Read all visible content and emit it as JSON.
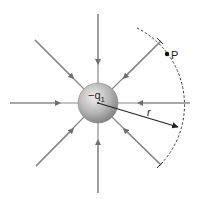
{
  "diagram": {
    "type": "electric-field-lines",
    "charge": {
      "label": "−q",
      "subscript": "1",
      "center": [
        98,
        103
      ],
      "radius": 20
    },
    "field_lines": {
      "count": 8,
      "direction": "inward",
      "color": "#8a8a8a"
    },
    "point": {
      "label": "P",
      "position": [
        167,
        54
      ]
    },
    "radius_vector": {
      "label": "r",
      "from": [
        98,
        103
      ],
      "to": [
        178,
        127
      ]
    },
    "dashed_arc": {
      "radius": 86,
      "style": "dashed"
    }
  },
  "colors": {
    "line": "#8a8a8a",
    "arrow": "#333333",
    "sphere_light": "#e4e4e4",
    "sphere_dark": "#8c8c8c",
    "text": "#222222"
  }
}
